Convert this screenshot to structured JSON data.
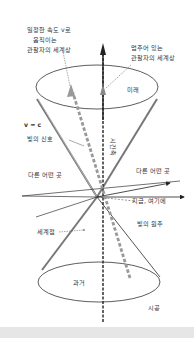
{
  "diagram": {
    "labels": {
      "moving_observer": [
        "일정한 속도 v로",
        "움직이는",
        "관찰자의 세계상"
      ],
      "stationary_observer": [
        "멈추어 있는",
        "관찰자의 세계상"
      ],
      "future": "미래",
      "time_axis": "시간축",
      "v_equals_c": "v = c",
      "light_signal": "빛의 신호",
      "elsewhere_left": "다른 어떤 곳",
      "elsewhere_right": "다른 어떤 곳",
      "here_now": "지금, 여기에",
      "worldline": "세계점",
      "light_cone": "빛의 원추",
      "past": "과거",
      "spacetime": "시공"
    },
    "colors": {
      "line": "#333333",
      "grey_arrow": "#999999",
      "cone_edge": "#777777",
      "footer": "#e6e6e6"
    }
  }
}
